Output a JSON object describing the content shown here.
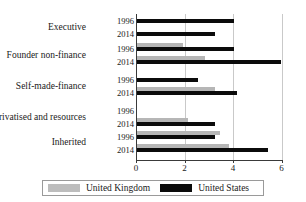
{
  "chart_data": {
    "type": "bar",
    "orientation": "horizontal",
    "title": "",
    "xlabel": "",
    "ylabel": "",
    "xlim": [
      0,
      6
    ],
    "xticks": [
      0,
      2,
      4,
      6
    ],
    "xtick_labels": [
      "0",
      "2",
      "4",
      "6"
    ],
    "grid": true,
    "legend_position": "bottom",
    "categories": [
      "Executive",
      "Founder non-finance",
      "Self-made-finance",
      "Privatised and resources",
      "Inherited"
    ],
    "subgroups": [
      "1996",
      "2014"
    ],
    "series": [
      {
        "name": "United Kingdom",
        "color": "#b6b6b6",
        "values": {
          "Executive": {
            "1996": 0,
            "2014": 0
          },
          "Founder non-finance": {
            "1996": 1.9,
            "2014": 2.8
          },
          "Self-made-finance": {
            "1996": 0,
            "2014": 3.2
          },
          "Privatised and resources": {
            "1996": 0,
            "2014": 2.1
          },
          "Inherited": {
            "1996": 3.4,
            "2014": 3.8
          }
        }
      },
      {
        "name": "United States",
        "color": "#0b0b0b",
        "values": {
          "Executive": {
            "1996": 4.0,
            "2014": 3.2
          },
          "Founder non-finance": {
            "1996": 4.0,
            "2014": 5.9
          },
          "Self-made-finance": {
            "1996": 2.5,
            "2014": 4.1
          },
          "Privatised and resources": {
            "1996": 0,
            "2014": 3.2
          },
          "Inherited": {
            "1996": 3.2,
            "2014": 5.4
          }
        }
      }
    ]
  },
  "legend": {
    "items": [
      {
        "label": "United Kingdom",
        "swatch": "uk"
      },
      {
        "label": "United States",
        "swatch": "us"
      }
    ]
  }
}
